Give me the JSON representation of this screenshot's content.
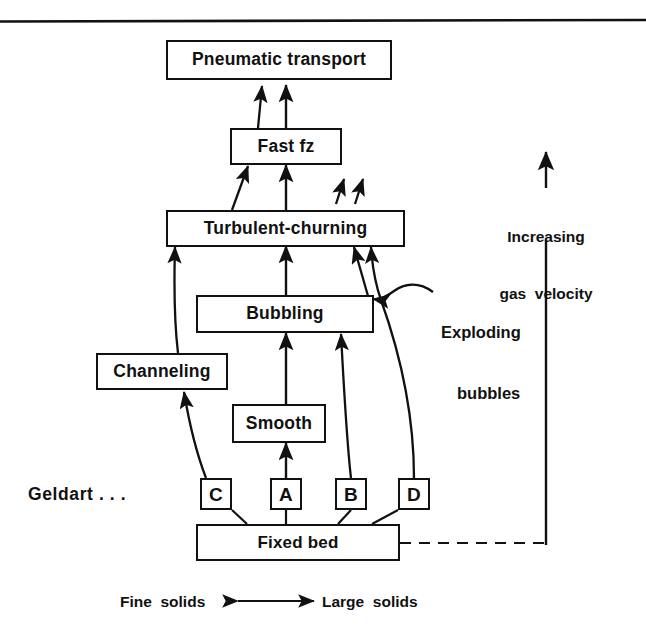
{
  "figure": {
    "ink_color": "#111111",
    "background": "#ffffff"
  },
  "top_rule": {
    "present": true
  },
  "nodes": {
    "pneumatic_transport": {
      "label": "Pneumatic  transport"
    },
    "fast_fz": {
      "label": "Fast  fz"
    },
    "turbulent_churning": {
      "label": "Turbulent-churning"
    },
    "bubbling": {
      "label": "Bubbling"
    },
    "channeling": {
      "label": "Channeling"
    },
    "smooth": {
      "label": "Smooth"
    },
    "fixed_bed": {
      "label": "Fixed bed"
    }
  },
  "geldart": {
    "prefix_label": "Geldart . . .",
    "classes": [
      {
        "id": "C",
        "label": "C"
      },
      {
        "id": "A",
        "label": "A"
      },
      {
        "id": "B",
        "label": "B"
      },
      {
        "id": "D",
        "label": "D"
      }
    ]
  },
  "annotations": {
    "gas_velocity": {
      "line1": "Increasing",
      "line2": "gas  velocity"
    },
    "exploding_bubbles": {
      "line1": "Exploding",
      "line2": "bubbles"
    }
  },
  "axis": {
    "left_label": "Fine  solids",
    "right_label": "Large  solids",
    "arrow": "double-headed-horizontal"
  },
  "icons": {
    "up_arrow": "arrow-up-icon",
    "double_arrow": "arrow-left-right-icon",
    "dashed_connector": "dashed-line-icon"
  }
}
